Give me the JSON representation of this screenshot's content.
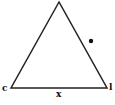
{
  "diagram": {
    "shape": "triangle",
    "vertices": {
      "apex": [
        59,
        2
      ],
      "left": [
        11,
        88
      ],
      "right": [
        107,
        88
      ]
    },
    "labels": {
      "left_vertex": "c",
      "right_vertex": "l",
      "base_mark": "x"
    },
    "dot": [
      91,
      41
    ],
    "stroke_color": "#222222"
  }
}
